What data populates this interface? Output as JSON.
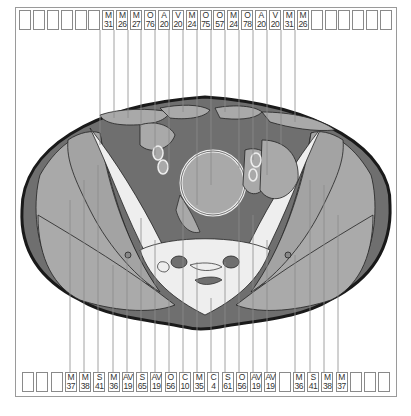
{
  "figure": {
    "title": ""
  },
  "colors": {
    "fat": "#6f6f6f",
    "muscle": "#a9a9a9",
    "bone": "#eeeeee",
    "outline": "#1a1a1a",
    "leader": "#8c8c8c",
    "box_border": "#8a8a8a"
  },
  "top_labels": [
    {
      "letter": "",
      "num": ""
    },
    {
      "letter": "",
      "num": ""
    },
    {
      "letter": "",
      "num": ""
    },
    {
      "letter": "",
      "num": ""
    },
    {
      "letter": "",
      "num": ""
    },
    {
      "letter": "",
      "num": ""
    },
    {
      "letter": "M",
      "num": "31"
    },
    {
      "letter": "M",
      "num": "26"
    },
    {
      "letter": "M",
      "num": "27"
    },
    {
      "letter": "O",
      "num": "76"
    },
    {
      "letter": "A",
      "num": "20"
    },
    {
      "letter": "V",
      "num": "20"
    },
    {
      "letter": "M",
      "num": "24"
    },
    {
      "letter": "O",
      "num": "75"
    },
    {
      "letter": "O",
      "num": "57"
    },
    {
      "letter": "M",
      "num": "24"
    },
    {
      "letter": "O",
      "num": "78"
    },
    {
      "letter": "A",
      "num": "20"
    },
    {
      "letter": "V",
      "num": "20"
    },
    {
      "letter": "M",
      "num": "31"
    },
    {
      "letter": "M",
      "num": "26"
    },
    {
      "letter": "",
      "num": ""
    },
    {
      "letter": "",
      "num": ""
    },
    {
      "letter": "",
      "num": ""
    },
    {
      "letter": "",
      "num": ""
    },
    {
      "letter": "",
      "num": ""
    },
    {
      "letter": "",
      "num": ""
    }
  ],
  "bottom_labels": [
    {
      "letter": "",
      "num": ""
    },
    {
      "letter": "",
      "num": ""
    },
    {
      "letter": "",
      "num": ""
    },
    {
      "letter": "M",
      "num": "37"
    },
    {
      "letter": "M",
      "num": "38"
    },
    {
      "letter": "S",
      "num": "41"
    },
    {
      "letter": "M",
      "num": "36"
    },
    {
      "letter": "AV",
      "num": "19"
    },
    {
      "letter": "S",
      "num": "65"
    },
    {
      "letter": "AV",
      "num": "19"
    },
    {
      "letter": "O",
      "num": "56"
    },
    {
      "letter": "C",
      "num": "10"
    },
    {
      "letter": "M",
      "num": "35"
    },
    {
      "letter": "C",
      "num": "4"
    },
    {
      "letter": "S",
      "num": "61"
    },
    {
      "letter": "O",
      "num": "56"
    },
    {
      "letter": "AV",
      "num": "19"
    },
    {
      "letter": "AV",
      "num": "19"
    },
    {
      "letter": "",
      "num": ""
    },
    {
      "letter": "M",
      "num": "36"
    },
    {
      "letter": "S",
      "num": "41"
    },
    {
      "letter": "M",
      "num": "38"
    },
    {
      "letter": "M",
      "num": "37"
    },
    {
      "letter": "",
      "num": ""
    },
    {
      "letter": "",
      "num": ""
    },
    {
      "letter": "",
      "num": ""
    }
  ]
}
